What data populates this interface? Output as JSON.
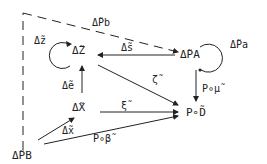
{
  "nodes": {
    "dz_node": "Δ̃Z",
    "dpa_node": "Δ̃PA",
    "dx_node": "Δ̃X",
    "pd_node": "P∘D̃",
    "dpb_node": "Δ̃PB"
  },
  "edges": {
    "dpb_to_dpa": "Δ̃Pb",
    "dz_loop": "Δ̃z",
    "dpa_to_dz": "Δ̃s",
    "dpa_loop": "Δ̃Pa",
    "dx_to_dz": "Δ̃e",
    "dz_to_pd": "ζ̃",
    "dpa_to_pd": "P∘μ̃",
    "dx_to_pd": "ξ̃",
    "dpb_to_dx": "Δ̃x",
    "dpb_to_pd": "P∘β̃"
  }
}
